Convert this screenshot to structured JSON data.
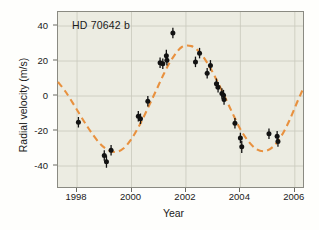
{
  "chart_data": {
    "type": "scatter",
    "title": "HD 70642 b",
    "xlabel": "Year",
    "ylabel": "Radial velocity (m/s)",
    "xlim": [
      1997.3,
      2006.3
    ],
    "ylim": [
      -52,
      48
    ],
    "xticks": [
      1998,
      2000,
      2002,
      2004,
      2006
    ],
    "xticklabels": [
      "1998",
      "2000",
      "2002",
      "2004",
      "2006"
    ],
    "yticks": [
      40,
      20,
      0,
      -20,
      -40
    ],
    "yticklabels": [
      "40",
      "20",
      "0",
      "-20",
      "-40"
    ],
    "grid": true,
    "legend": "none",
    "background_color": "#ecece2",
    "series": [
      {
        "name": "Radial velocity measurements",
        "type": "scatter",
        "marker": "filled-circle",
        "color": "#121212",
        "errorbars": "vertical",
        "points": [
          {
            "x": 1998.05,
            "y": -15.0,
            "yerr": 3.0
          },
          {
            "x": 1999.0,
            "y": -34.0,
            "yerr": 3.0
          },
          {
            "x": 1999.08,
            "y": -37.5,
            "yerr": 3.5
          },
          {
            "x": 1999.25,
            "y": -31.0,
            "yerr": 3.0
          },
          {
            "x": 2000.25,
            "y": -11.5,
            "yerr": 3.0
          },
          {
            "x": 2000.33,
            "y": -13.0,
            "yerr": 3.0
          },
          {
            "x": 2000.6,
            "y": -3.0,
            "yerr": 3.0
          },
          {
            "x": 2001.05,
            "y": 19.0,
            "yerr": 3.0
          },
          {
            "x": 2001.15,
            "y": 18.5,
            "yerr": 3.0
          },
          {
            "x": 2001.28,
            "y": 23.0,
            "yerr": 3.5
          },
          {
            "x": 2001.3,
            "y": 20.5,
            "yerr": 3.0
          },
          {
            "x": 2001.52,
            "y": 36.0,
            "yerr": 3.0
          },
          {
            "x": 2002.35,
            "y": 19.5,
            "yerr": 3.0
          },
          {
            "x": 2002.5,
            "y": 24.5,
            "yerr": 3.0
          },
          {
            "x": 2002.78,
            "y": 13.0,
            "yerr": 3.0
          },
          {
            "x": 2002.9,
            "y": 17.5,
            "yerr": 3.0
          },
          {
            "x": 2003.12,
            "y": 7.0,
            "yerr": 3.0
          },
          {
            "x": 2003.18,
            "y": 5.0,
            "yerr": 3.0
          },
          {
            "x": 2003.32,
            "y": 1.5,
            "yerr": 3.0
          },
          {
            "x": 2003.38,
            "y": 0.5,
            "yerr": 3.0
          },
          {
            "x": 2003.4,
            "y": -2.0,
            "yerr": 3.0
          },
          {
            "x": 2003.8,
            "y": -15.5,
            "yerr": 3.0
          },
          {
            "x": 2004.0,
            "y": -24.0,
            "yerr": 3.0
          },
          {
            "x": 2004.05,
            "y": -29.0,
            "yerr": 3.5
          },
          {
            "x": 2005.05,
            "y": -21.5,
            "yerr": 3.0
          },
          {
            "x": 2005.35,
            "y": -23.0,
            "yerr": 3.0
          },
          {
            "x": 2005.38,
            "y": -26.0,
            "yerr": 3.0
          }
        ]
      },
      {
        "name": "Keplerian orbital fit",
        "type": "line",
        "style": "dashed",
        "color": "#e8913f",
        "amplitude": 31.5,
        "offset": -2.5,
        "period_years": 5.95,
        "phase_peak_year": 2001.85,
        "curve_points": [
          {
            "x": 1997.3,
            "y": 8.0
          },
          {
            "x": 1997.6,
            "y": 2.0
          },
          {
            "x": 1998.0,
            "y": -8.0
          },
          {
            "x": 1998.4,
            "y": -18.0
          },
          {
            "x": 1998.8,
            "y": -26.5
          },
          {
            "x": 1999.1,
            "y": -30.5
          },
          {
            "x": 1999.4,
            "y": -32.0
          },
          {
            "x": 1999.7,
            "y": -30.0
          },
          {
            "x": 2000.0,
            "y": -24.5
          },
          {
            "x": 2000.3,
            "y": -16.5
          },
          {
            "x": 2000.6,
            "y": -7.0
          },
          {
            "x": 2000.9,
            "y": 3.0
          },
          {
            "x": 2001.2,
            "y": 13.0
          },
          {
            "x": 2001.5,
            "y": 21.5
          },
          {
            "x": 2001.85,
            "y": 28.0
          },
          {
            "x": 2002.2,
            "y": 28.5
          },
          {
            "x": 2002.5,
            "y": 25.0
          },
          {
            "x": 2002.8,
            "y": 18.5
          },
          {
            "x": 2003.1,
            "y": 10.0
          },
          {
            "x": 2003.4,
            "y": 0.5
          },
          {
            "x": 2003.7,
            "y": -9.5
          },
          {
            "x": 2004.0,
            "y": -19.0
          },
          {
            "x": 2004.3,
            "y": -26.0
          },
          {
            "x": 2004.6,
            "y": -30.5
          },
          {
            "x": 2004.9,
            "y": -31.5
          },
          {
            "x": 2005.2,
            "y": -29.0
          },
          {
            "x": 2005.5,
            "y": -23.0
          },
          {
            "x": 2005.8,
            "y": -14.0
          },
          {
            "x": 2006.1,
            "y": -3.0
          },
          {
            "x": 2006.3,
            "y": 4.0
          }
        ]
      }
    ]
  }
}
